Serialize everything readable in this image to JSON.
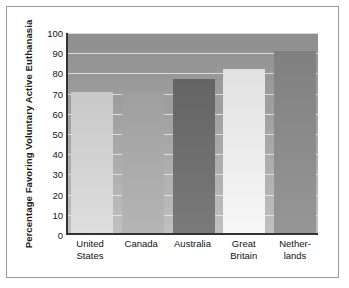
{
  "chart_data": {
    "type": "bar",
    "title": "",
    "xlabel": "",
    "ylabel": "Percentage Favoring Voluntary Active Euthanasia",
    "categories": [
      "United States",
      "Canada",
      "Australia",
      "Great Britain",
      "Netherlands"
    ],
    "category_lines": [
      [
        "United",
        "States"
      ],
      [
        "Canada",
        ""
      ],
      [
        "Australia",
        ""
      ],
      [
        "Great",
        "Britain"
      ],
      [
        "Nether-",
        "lands"
      ]
    ],
    "values": [
      70,
      70,
      76,
      81,
      90
    ],
    "ylim": [
      0,
      100
    ],
    "yticks": [
      0,
      10,
      20,
      30,
      40,
      50,
      60,
      70,
      80,
      90,
      100
    ],
    "ytick_labels": [
      "0",
      "10",
      "20",
      "30",
      "40",
      "50",
      "60",
      "70",
      "80",
      "90",
      "100"
    ],
    "grid": true,
    "legend": false,
    "bar_colors": [
      "#d2d2d2",
      "#a9a9a9",
      "#6e6e6e",
      "#ebebeb",
      "#8a8a8a"
    ],
    "plot_background": "#a0a0a0",
    "gridline_color": "#e8e8e8",
    "axis_color": "#333333",
    "frame_color": "#9a9a9a",
    "text_color": "#151515"
  }
}
